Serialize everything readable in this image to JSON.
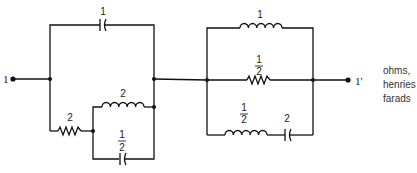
{
  "diagram": {
    "type": "circuit",
    "terminals": {
      "input": "1",
      "output": "1'"
    },
    "units_note": [
      "ohms,",
      "henries",
      "farads"
    ],
    "left_network": {
      "top_capacitor": {
        "value": "1",
        "kind": "capacitor"
      },
      "series_resistor": {
        "value": "2",
        "kind": "resistor"
      },
      "inner_inductor": {
        "value": "2",
        "kind": "inductor"
      },
      "inner_capacitor": {
        "value_num": "1",
        "value_den": "2",
        "kind": "capacitor"
      }
    },
    "right_network": {
      "top_inductor": {
        "value": "1",
        "kind": "inductor"
      },
      "middle_resistor": {
        "value_num": "1",
        "value_den": "2",
        "kind": "resistor"
      },
      "bottom_inductor": {
        "value_num": "1",
        "value_den": "2",
        "kind": "inductor"
      },
      "bottom_capacitor": {
        "value": "2",
        "kind": "capacitor"
      }
    }
  }
}
